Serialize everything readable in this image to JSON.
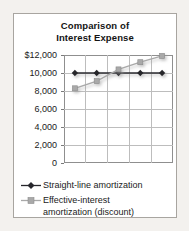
{
  "card": {
    "background": "#ffffff",
    "border_color": "#a8a5a0"
  },
  "chart_data": {
    "type": "line",
    "title": "Comparison of Interest Expense",
    "title_line1": "Comparison of",
    "title_line2": "Interest Expense",
    "categories": [
      1,
      2,
      3,
      4,
      5
    ],
    "series": [
      {
        "name": "Straight-line amortization",
        "values": [
          10000,
          10000,
          10000,
          10000,
          10000
        ],
        "color": "#26262c",
        "marker": "diamond"
      },
      {
        "name": "Effective-interest amortization (discount)",
        "values": [
          8300,
          9100,
          10400,
          11200,
          11900
        ],
        "color": "#a9a9a9",
        "marker": "square",
        "marker_edge": "#8c8c8c"
      }
    ],
    "ylim": [
      0,
      12000
    ],
    "ytick_labels": [
      "$12,000",
      "10,000",
      "8,000",
      "6,000",
      "4,000",
      "2,000",
      "0"
    ],
    "grid": true,
    "gridline_color": "#bdbdbd",
    "legend_position": "bottom"
  }
}
